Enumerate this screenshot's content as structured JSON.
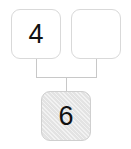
{
  "diagram": {
    "type": "number-bond-tree",
    "nodes": [
      {
        "id": "addend-left",
        "label": "4",
        "filled": false,
        "empty": false
      },
      {
        "id": "addend-right",
        "label": "",
        "filled": false,
        "empty": true
      },
      {
        "id": "sum",
        "label": "6",
        "filled": true,
        "empty": false
      }
    ],
    "colors": {
      "box_border": "#d9d9d9",
      "box_fill_empty": "#ffffff",
      "box_fill_shaded": "#e3e3e3",
      "connector_line": "#c8c8c8",
      "text": "#111111",
      "background": "#ffffff"
    },
    "connectors": {
      "left_stem_x": 36,
      "right_stem_x": 96,
      "center_stem_x": 66,
      "stem_top_y": 59,
      "crossbar_y": 77,
      "stem_bottom_y": 91
    }
  }
}
